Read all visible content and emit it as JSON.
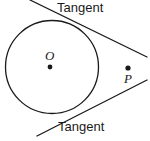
{
  "figure": {
    "background_color": "#ffffff",
    "stroke_color": "#1a1a1a",
    "labels": {
      "tangent_top": "Tangent",
      "tangent_bottom": "Tangent",
      "center": "O",
      "external_point": "P"
    },
    "geometry": {
      "circle": {
        "cx": 52,
        "cy": 67,
        "r": 46.5
      },
      "center_dot": {
        "cx": 50,
        "cy": 67,
        "r": 2.4
      },
      "external_point_dot": {
        "cx": 128,
        "cy": 68,
        "r": 2.6
      },
      "tangent_top_line": {
        "x1": 30,
        "y1": 0,
        "x2": 147,
        "y2": 57
      },
      "tangent_bottom_line": {
        "x1": 37,
        "y1": 136,
        "x2": 147,
        "y2": 80
      }
    }
  }
}
